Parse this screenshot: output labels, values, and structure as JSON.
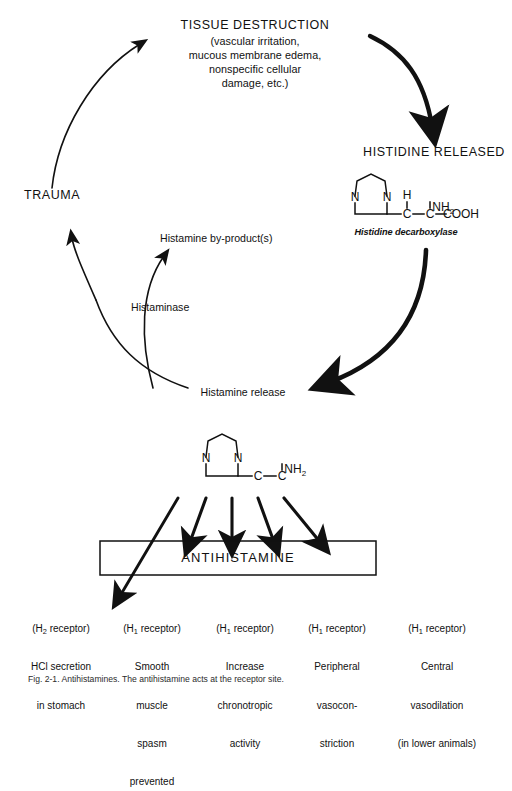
{
  "figure": {
    "background_color": "#ffffff",
    "ink_color": "#111111",
    "caption": "Fig. 2-1. Antihistamines. The antihistamine acts at the receptor site."
  },
  "cycle": {
    "tissue_destruction": {
      "heading": "TISSUE DESTRUCTION",
      "detail_lines": [
        "(vascular irritation,",
        "mucous membrane edema,",
        "nonspecific cellular",
        "damage, etc.)"
      ]
    },
    "trauma_label": "TRAUMA",
    "histidine_released_label": "HISTIDINE RELEASED",
    "histidine_enzyme_label": "Histidine decarboxylase",
    "histamine_release_label": "Histamine release",
    "histaminase_label": "Histaminase",
    "byproducts_label": "Histamine by-product(s)"
  },
  "histidine_molecule": {
    "ring_atoms": [
      "N",
      "N"
    ],
    "chain": [
      "C",
      "C",
      "COOH"
    ],
    "substituents": [
      "H",
      "NH2"
    ],
    "h_label": "H",
    "nh2_label": "NH",
    "nh2_sub": "2",
    "cooh_label": "COOH",
    "c_label": "C",
    "dash": "-"
  },
  "histamine_molecule": {
    "ring_atoms": [
      "N",
      "N"
    ],
    "chain": [
      "C",
      "C"
    ],
    "nh2_label": "NH",
    "nh2_sub": "2",
    "c_label": "C",
    "dash": "-"
  },
  "antihistamine_box": {
    "label": "ANTIHISTAMINE",
    "arrow_count": 5
  },
  "receptor_effects": [
    {
      "receptor_prefix": "(H",
      "receptor_sub": "2",
      "receptor_suffix": " receptor)",
      "lines": [
        "HCl secretion",
        "in stomach"
      ]
    },
    {
      "receptor_prefix": "(H",
      "receptor_sub": "1",
      "receptor_suffix": " receptor)",
      "lines": [
        "Smooth",
        "muscle",
        "spasm",
        "prevented"
      ]
    },
    {
      "receptor_prefix": "(H",
      "receptor_sub": "1",
      "receptor_suffix": " receptor)",
      "lines": [
        "Increase",
        "chronotropic",
        "activity"
      ]
    },
    {
      "receptor_prefix": "(H",
      "receptor_sub": "1",
      "receptor_suffix": " receptor)",
      "lines": [
        "Peripheral",
        "vasocon-",
        "striction"
      ]
    },
    {
      "receptor_prefix": "(H",
      "receptor_sub": "1",
      "receptor_suffix": " receptor)",
      "lines": [
        "Central",
        "vasodilation",
        "(in lower animals)"
      ]
    }
  ]
}
